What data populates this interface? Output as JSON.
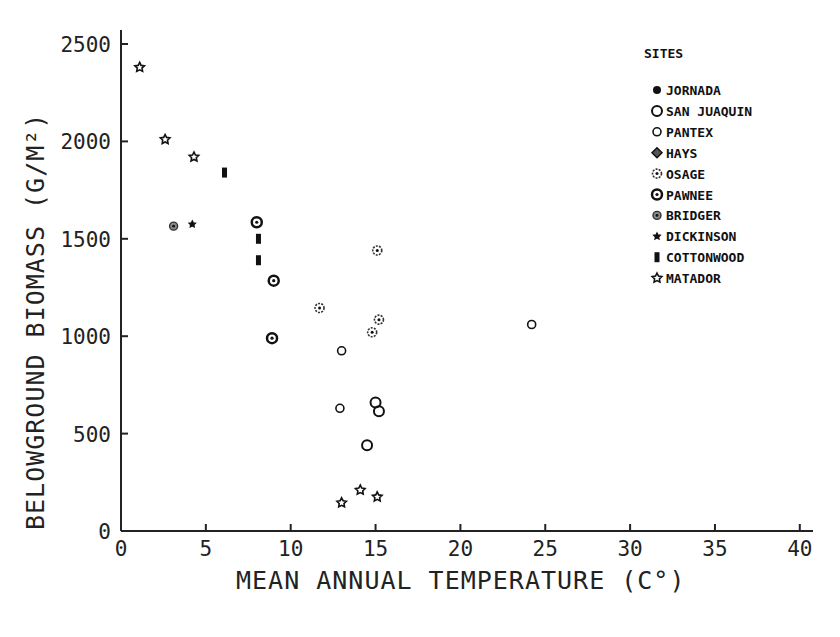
{
  "chart_data": {
    "type": "scatter",
    "title": "",
    "xlabel": "MEAN ANNUAL TEMPERATURE (C°)",
    "ylabel": "BELOWGROUND BIOMASS (G/M²)",
    "xlim": [
      0,
      40
    ],
    "ylim": [
      0,
      2500
    ],
    "xticks": [
      0,
      5,
      10,
      15,
      20,
      25,
      30,
      35,
      40
    ],
    "yticks": [
      0,
      500,
      1000,
      1500,
      2000,
      2500
    ],
    "grid": false,
    "legend": {
      "title": "SITES",
      "position": "upper-right",
      "entries": [
        "JORNADA",
        "SAN JUAQUIN",
        "PANTEX",
        "HAYS",
        "OSAGE",
        "PAWNEE",
        "BRIDGER",
        "DICKINSON",
        "COTTONWOOD",
        "MATADOR"
      ]
    },
    "series": [
      {
        "name": "JORNADA",
        "marker": "filled-circle",
        "points": []
      },
      {
        "name": "SAN JUAQUIN",
        "marker": "open-circle-large",
        "points": [
          [
            15.0,
            660
          ],
          [
            15.2,
            615
          ],
          [
            14.5,
            440
          ]
        ]
      },
      {
        "name": "PANTEX",
        "marker": "open-circle-small",
        "points": [
          [
            13.0,
            925
          ],
          [
            12.9,
            630
          ],
          [
            24.2,
            1060
          ]
        ]
      },
      {
        "name": "HAYS",
        "marker": "half-filled-diamond",
        "points": []
      },
      {
        "name": "OSAGE",
        "marker": "dotted-circle",
        "points": [
          [
            15.1,
            1440
          ],
          [
            11.7,
            1145
          ],
          [
            15.2,
            1085
          ],
          [
            14.8,
            1020
          ]
        ]
      },
      {
        "name": "PAWNEE",
        "marker": "ring-circle",
        "points": [
          [
            8.0,
            1585
          ],
          [
            9.0,
            1285
          ],
          [
            8.9,
            990
          ]
        ]
      },
      {
        "name": "BRIDGER",
        "marker": "hatched-circle",
        "points": [
          [
            3.1,
            1565
          ]
        ]
      },
      {
        "name": "DICKINSON",
        "marker": "small-star",
        "points": [
          [
            4.2,
            1575
          ]
        ]
      },
      {
        "name": "COTTONWOOD",
        "marker": "filled-rect",
        "points": [
          [
            6.1,
            1840
          ],
          [
            8.1,
            1500
          ],
          [
            8.1,
            1390
          ]
        ]
      },
      {
        "name": "MATADOR",
        "marker": "open-star",
        "points": [
          [
            1.1,
            2380
          ],
          [
            2.6,
            2010
          ],
          [
            4.3,
            1920
          ],
          [
            14.1,
            210
          ],
          [
            15.1,
            175
          ],
          [
            13.0,
            145
          ]
        ]
      }
    ]
  }
}
